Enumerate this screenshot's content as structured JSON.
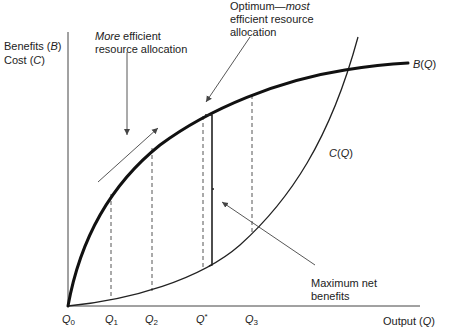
{
  "diagram": {
    "title": "",
    "y_axis_label": {
      "line1_prefix": "Benefits (",
      "line1_var": "B",
      "line1_suffix": ")",
      "line2_prefix": "Cost (",
      "line2_var": "C",
      "line2_suffix": ")"
    },
    "x_axis_label": {
      "prefix": "Output (",
      "var": "Q",
      "suffix": ")"
    },
    "curves": {
      "benefit": {
        "var": "B",
        "arg": "(Q)",
        "label": "B(Q)"
      },
      "cost": {
        "var": "C",
        "arg": "(Q)",
        "label": "C(Q)"
      }
    },
    "ticks": [
      {
        "var": "Q",
        "sub": "0",
        "label": "Q0"
      },
      {
        "var": "Q",
        "sub": "1",
        "label": "Q1"
      },
      {
        "var": "Q",
        "sub": "2",
        "label": "Q2"
      },
      {
        "var": "Q",
        "sub": "*",
        "label": "Q*"
      },
      {
        "var": "Q",
        "sub": "3",
        "label": "Q3"
      }
    ],
    "annotations": {
      "more_efficient": {
        "italic": "More",
        "rest_line1": " efficient",
        "line2": "resource allocation"
      },
      "optimum": {
        "line1_plain": "Optimum—",
        "line1_italic": "most",
        "line2": "efficient resource",
        "line3": "allocation"
      },
      "max_net_benefits": {
        "line1": "Maximum net",
        "line2": "benefits"
      }
    }
  }
}
